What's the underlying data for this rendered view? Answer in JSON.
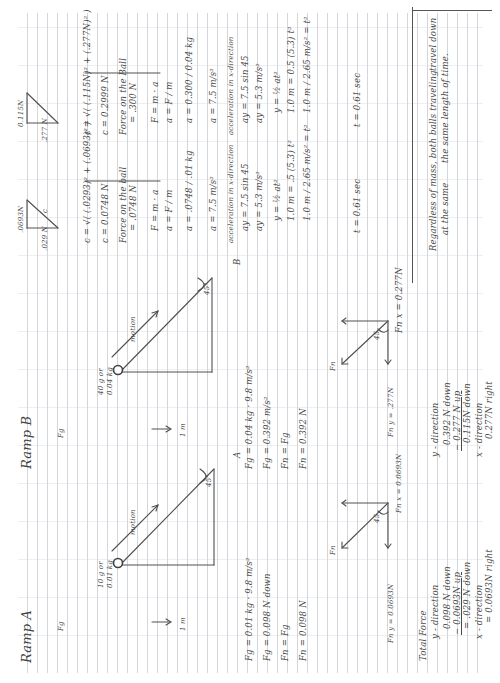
{
  "document": {
    "type": "handwritten physics worksheet (scanned, rotated 90° counter-clockwise)",
    "rotation_deg": -90,
    "ink_color": "#4a4a4a",
    "rule_color": "#cfd2d6"
  },
  "ramp_a": {
    "title": "Ramp A",
    "gravity_label": "Fg",
    "ball_mass": "10 g or",
    "ball_mass_kg": "0.01 kg",
    "motion_label": "motion",
    "angle": "45°",
    "base_length": "1 m",
    "point_label": "A",
    "calc": [
      "Fg = 0.01 kg · 9.8 m/s²",
      "Fg = 0.098 N down",
      "Fn = Fg",
      "Fn = 0.098 N"
    ],
    "vector": {
      "fn_label": "Fn",
      "angle": "45",
      "fn_x": "Fn x = 0.0693N",
      "fn_y": "Fn y = 0.0693N"
    },
    "total": {
      "heading": "Total Force",
      "y_heading": "y - direction",
      "y_line1": "0.098 N down",
      "y_line2": "− 0.0693N up",
      "y_result": "= .029 N down",
      "x_heading": "x - direction",
      "x_result": "= 0.0693N right"
    }
  },
  "ramp_b": {
    "title": "Ramp B",
    "gravity_label": "Fg",
    "ball_mass": "40 g or",
    "ball_mass_kg": "0.04 kg",
    "motion_label": "motion",
    "angle": "45°",
    "base_length": "1 m",
    "point_label": "B",
    "calc": [
      "Fg = 0.04 kg · 9.8 m/s²",
      "Fg = 0.392 m/s²",
      "Fn = Fg",
      "Fn = 0.392 N"
    ],
    "vector": {
      "fn_label": "Fn",
      "angle": "45",
      "fn_x": "Fn x = 0.277N",
      "fn_y": "Fn y = .277N"
    },
    "total": {
      "y_heading": "y - direction",
      "y_line1": "0.392 N down",
      "y_line2": "− 0.277 N up",
      "y_result": "0.115N down",
      "x_heading": "x - direction",
      "x_result": "0.277N right"
    }
  },
  "solution_a": {
    "tri_x": ".0693N",
    "tri_y": ".029 N",
    "tri_h": "c",
    "lines": [
      "c = √( (.0293)² + (.0693)² )",
      "c = 0.0748 N",
      "Force on the ball",
      "= .0748 N",
      "F = m · a",
      "a = F / m",
      "a = .0748 / .01 kg",
      "a = 7.5 m/s²",
      "acceleration in x-direction",
      "ay = 7.5 sin 45",
      "ay = 5.3 m/s²",
      "y = ½ at²",
      "1.0 m = .5 (5.3) t²",
      "1.0 m / 2.65 m/s² = t²",
      "t = 0.61 sec"
    ],
    "conclusion_1": "Regardless of mass, both balls traveling",
    "conclusion_2": "the same length of time."
  },
  "solution_b": {
    "tri_x": "0.115N",
    "tri_y": ".277 N",
    "lines": [
      "c = √( (.115N)² + (.277N)² )",
      "c = 0.2999 N",
      "Force on the Ball",
      "= .300 N",
      "F = m · a",
      "a = F / m",
      "a = 0.300 / 0.04 kg",
      "a = 7.5 m/s²",
      "acceleration in x-direction",
      "ay = 7.5 sin 45",
      "ay = 5.3 m/s²",
      "y = ½ at²",
      "1.0 m = 0.5 (5.3) t²",
      "1.0 m / 2.65 m/s² = t²",
      "t = 0.61 sec"
    ],
    "conclusion_1": "travel down",
    "conclusion_2": "at the same"
  }
}
